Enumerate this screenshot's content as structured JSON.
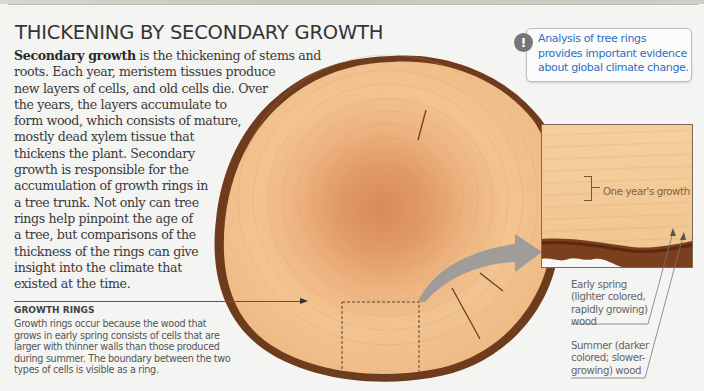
{
  "page": {
    "title": "THICKENING BY SECONDARY GROWTH",
    "intro": {
      "bold_term": "Secondary growth",
      "lines": [
        " is the thickening of stems and",
        "roots. Each year, meristem tissues produce",
        "new layers of cells, and old cells die. Over",
        "the years, the layers accumulate to",
        "form wood, which consists of mature,",
        "mostly dead xylem tissue that",
        "thickens the plant. Secondary",
        "growth is responsible for the",
        "accumulation of growth rings in",
        "a tree trunk. Not only can tree",
        "rings help pinpoint the age of",
        "a tree, but comparisons of the",
        "thickness of the rings can give",
        "insight into the climate that",
        "existed at the time."
      ]
    },
    "callout": {
      "icon": "exclamation-icon",
      "text": "Analysis of tree rings provides important evidence about global climate change.",
      "color": "#2e6fc2"
    },
    "growth_rings": {
      "heading": "GROWTH RINGS",
      "lines": [
        "Growth rings occur because the wood that",
        "grows in early spring consists of cells that are",
        "larger with thinner walls than those produced",
        "during summer. The boundary between the two",
        "types of cells is visible as a ring."
      ]
    },
    "detail": {
      "one_year_label": "One year's growth",
      "early_spring_lines": [
        "Early spring",
        "(lighter colored,",
        "rapidly growing)",
        "wood"
      ],
      "summer_lines": [
        "Summer (darker",
        "colored; slower-",
        "growing) wood"
      ]
    },
    "image": {
      "subject": "tree-trunk-cross-section",
      "wood_color": "#efc18c",
      "bark_color": "#6e3b1c",
      "arrow_color": "#9a9a9a"
    }
  }
}
